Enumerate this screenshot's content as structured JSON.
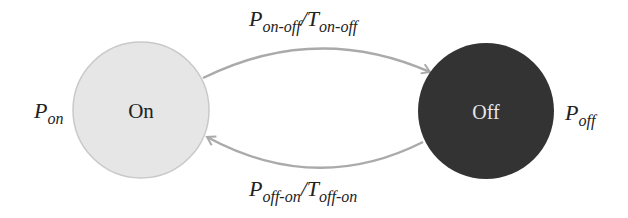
{
  "diagram": {
    "type": "state-transition",
    "colors": {
      "on_fill": "#e6e6e6",
      "on_stroke": "#c9c9c9",
      "off_fill": "#333333",
      "arrow": "#aaaaaa",
      "on_text": "#222222",
      "off_text": "#e8e8e8"
    },
    "states": [
      {
        "id": "on",
        "label": "On",
        "power": {
          "base": "P",
          "sub": "on"
        }
      },
      {
        "id": "off",
        "label": "Off",
        "power": {
          "base": "P",
          "sub": "off"
        }
      }
    ],
    "transitions": [
      {
        "from": "on",
        "to": "off",
        "power": {
          "base": "P",
          "sub": "on-off"
        },
        "sep": "/",
        "time": {
          "base": "T",
          "sub": "on-off"
        }
      },
      {
        "from": "off",
        "to": "on",
        "power": {
          "base": "P",
          "sub": "off-on"
        },
        "sep": "/",
        "time": {
          "base": "T",
          "sub": "off-on"
        }
      }
    ]
  }
}
